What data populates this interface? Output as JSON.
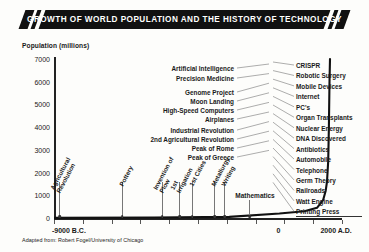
{
  "header": {
    "title": "GROWTH OF WORLD POPULATION AND THE HISTORY OF TECHNOLOGY"
  },
  "footer": {
    "credit": "Adapted from: Robert Fogel/University of Chicago"
  },
  "chart_data": {
    "type": "line",
    "title": "GROWTH OF WORLD POPULATION AND THE HISTORY OF TECHNOLOGY",
    "xlabel": "",
    "ylabel": "Population (millions)",
    "ylim": [
      0,
      7000
    ],
    "yticks": [
      0,
      1000,
      2000,
      3000,
      4000,
      5000,
      6000,
      7000
    ],
    "ytick_labels": [
      "0",
      "1000",
      "2000",
      "3000",
      "4000",
      "5000",
      "6000",
      "7000"
    ],
    "xlim": [
      -9000,
      2500
    ],
    "xtick_labels": [
      "-9000 B.C.",
      "0",
      "2000 A.D."
    ],
    "grid": false,
    "legend": false,
    "series": [
      {
        "name": "World population",
        "x": [
          -9000,
          -5000,
          -2000,
          0,
          1000,
          1500,
          1750,
          1850,
          1900,
          1950,
          1975,
          2000,
          2020
        ],
        "values": [
          5,
          20,
          50,
          200,
          300,
          450,
          800,
          1200,
          1600,
          2500,
          4000,
          6000,
          7000
        ]
      }
    ],
    "annotations": {
      "baseline_events": [
        {
          "label": "Agricultural Revolution",
          "x": -8800
        },
        {
          "label": "Pottery",
          "x": -6300
        },
        {
          "label": "Invention of Plow",
          "x": -4700
        },
        {
          "label": "1st Irrigation",
          "x": -4000
        },
        {
          "label": "1st Cities",
          "x": -3500
        },
        {
          "label": "Metallurgy",
          "x": -2600
        },
        {
          "label": "Writing",
          "x": -2200
        },
        {
          "label": "Mathematics",
          "x": -1200
        }
      ],
      "center_column": [
        "Artificial Intelligence",
        "Precision Medicine",
        "Genome Project",
        "Moon Landing",
        "High-Speed Computers",
        "Airplanes",
        "Industrial Revolution",
        "2nd Agricultural Revolution",
        "Peak of Rome",
        "Peak of Greece"
      ],
      "right_column": [
        "CRISPR",
        "Robotic Surgery",
        "Mobile Devices",
        "Internet",
        "PC's",
        "Organ Transplants",
        "Nuclear Energy",
        "DNA Discovered",
        "Antibiotics",
        "Automobile",
        "Telephone",
        "Germ Theory",
        "Railroads",
        "Watt Engine",
        "Printing Press"
      ]
    }
  },
  "colors": {
    "banner": "#111111",
    "curve": "#111111",
    "axis": "#222222",
    "leader": "#8a8a8a"
  }
}
